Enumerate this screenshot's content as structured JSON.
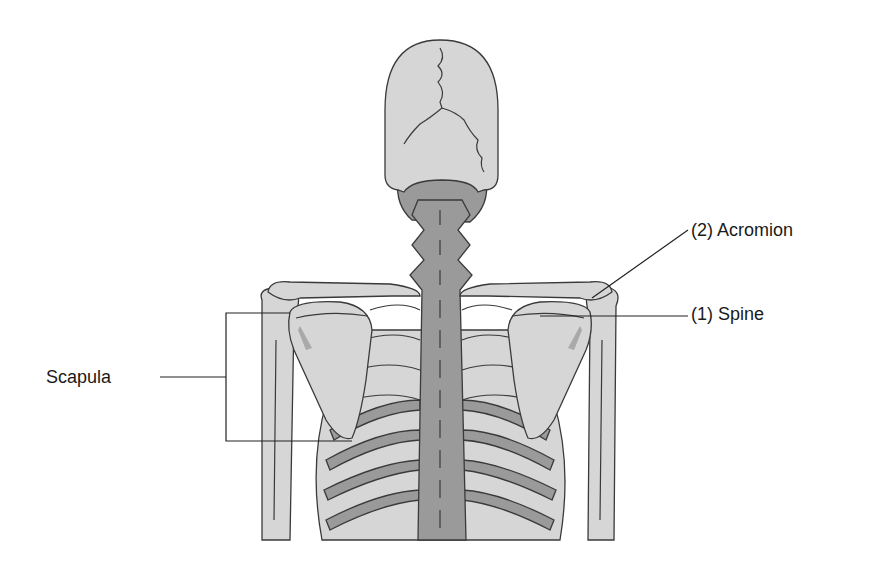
{
  "diagram": {
    "colors": {
      "bone_light": "#d6d6d6",
      "bone_dark": "#9a9a9a",
      "outline": "#3a3a3a",
      "background": "#ffffff",
      "label_text": "#1a1a1a"
    },
    "labels": {
      "acromion": "(2) Acromion",
      "spine": "(1) Spine",
      "scapula": "Scapula"
    }
  }
}
